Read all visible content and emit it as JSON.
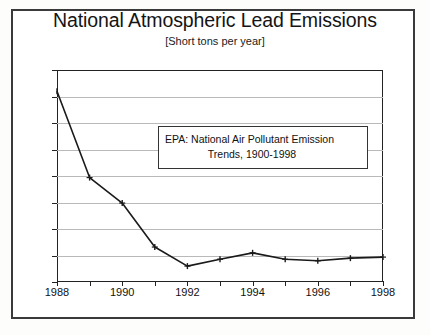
{
  "chart_data": {
    "type": "line",
    "title": "National Atmospheric Lead Emissions",
    "subtitle": "[Short tons per year]",
    "xlabel": "",
    "ylabel": "",
    "x": [
      1988,
      1989,
      1990,
      1991,
      1992,
      1993,
      1994,
      1995,
      1996,
      1997,
      1998
    ],
    "values": [
      7100,
      5470,
      4990,
      4160,
      3800,
      3930,
      4050,
      3930,
      3900,
      3950,
      3970
    ],
    "series": [
      {
        "name": "National Atmospheric Lead Emissions",
        "values": [
          7100,
          5470,
          4990,
          4160,
          3800,
          3930,
          4050,
          3930,
          3900,
          3950,
          3970
        ]
      }
    ],
    "xlim": [
      1988,
      1998
    ],
    "ylim": [
      3500,
      7500
    ],
    "yticks": [
      3500,
      4000,
      4500,
      5000,
      5500,
      6000,
      6500,
      7000,
      7500
    ],
    "ytick_labels": [
      "3500",
      "4000",
      "4500",
      "5000",
      "5500",
      "6000",
      "6500",
      "7000",
      "7500"
    ],
    "xticks": [
      1988,
      1989,
      1990,
      1991,
      1992,
      1993,
      1994,
      1995,
      1996,
      1997,
      1998
    ],
    "xtick_labels": [
      {
        "value": 1988,
        "label": "1988"
      },
      {
        "value": 1990,
        "label": "1990"
      },
      {
        "value": 1992,
        "label": "1992"
      },
      {
        "value": 1994,
        "label": "1994"
      },
      {
        "value": 1996,
        "label": "1996"
      },
      {
        "value": 1998,
        "label": "1998"
      }
    ],
    "grid": "horizontal",
    "legend": "none",
    "marker": "plus",
    "line_color": "#1a1a1a",
    "grid_color": "#b9b9b9",
    "annotations": [
      {
        "name": "source-note",
        "line1": "EPA: National Air Pollutant Emission",
        "line2": "Trends, 1900-1998"
      }
    ]
  }
}
